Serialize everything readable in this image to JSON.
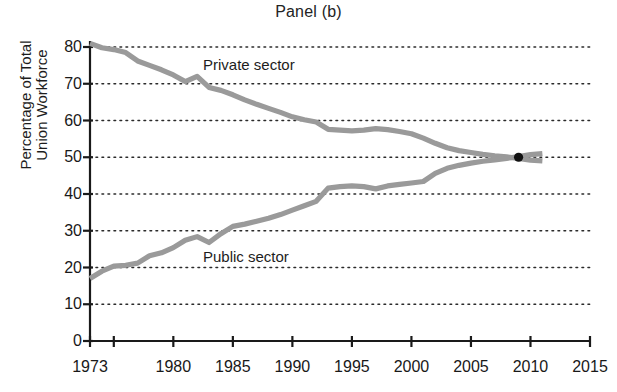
{
  "chart_data": {
    "type": "line",
    "title": "Panel (b)",
    "xlabel": "",
    "ylabel": "Percentage of Total Union Workforce",
    "ylabel_lines": [
      "Percentage of Total",
      "Union Workforce"
    ],
    "xlim": [
      1973,
      2015
    ],
    "ylim": [
      0,
      80
    ],
    "grid": true,
    "grid_style": "dotted-horizontal",
    "legend": "inline-annotations",
    "xticks": [
      1973,
      1980,
      1985,
      1990,
      1995,
      2000,
      2005,
      2010,
      2015
    ],
    "xtick_labels": [
      "1973",
      "1980",
      "1985",
      "1990",
      "1995",
      "2000",
      "2005",
      "2010",
      "2015"
    ],
    "xminor_ticks": [
      1975
    ],
    "yticks": [
      0,
      10,
      20,
      30,
      40,
      50,
      60,
      70,
      80
    ],
    "ytick_labels": [
      "0",
      "10",
      "20",
      "30",
      "40",
      "50",
      "60",
      "70",
      "80"
    ],
    "x": [
      1973,
      1974,
      1975,
      1976,
      1977,
      1978,
      1979,
      1980,
      1981,
      1982,
      1983,
      1984,
      1985,
      1986,
      1987,
      1988,
      1989,
      1990,
      1991,
      1992,
      1993,
      1994,
      1995,
      1996,
      1997,
      1998,
      1999,
      2000,
      2001,
      2002,
      2003,
      2004,
      2005,
      2006,
      2007,
      2008,
      2009,
      2010,
      2011
    ],
    "series": [
      {
        "name": "Private sector",
        "color": "#9a9a9a",
        "values": [
          81.0,
          79.8,
          79.3,
          78.5,
          76.2,
          75.0,
          73.8,
          72.4,
          70.6,
          72.0,
          69.0,
          68.2,
          67.0,
          65.6,
          64.4,
          63.3,
          62.2,
          61.0,
          60.2,
          59.6,
          57.6,
          57.4,
          57.2,
          57.4,
          57.8,
          57.5,
          57.0,
          56.4,
          55.2,
          53.8,
          52.6,
          51.8,
          51.3,
          50.8,
          50.4,
          50.1,
          49.7,
          49.2,
          49.0
        ]
      },
      {
        "name": "Public sector",
        "color": "#9a9a9a",
        "values": [
          17.0,
          19.0,
          20.4,
          20.6,
          21.2,
          23.2,
          24.0,
          25.4,
          27.4,
          28.4,
          26.8,
          29.2,
          31.2,
          31.8,
          32.6,
          33.4,
          34.4,
          35.6,
          36.8,
          38.0,
          41.6,
          42.0,
          42.2,
          42.0,
          41.4,
          42.2,
          42.6,
          43.0,
          43.4,
          45.6,
          47.0,
          47.8,
          48.4,
          48.9,
          49.3,
          49.7,
          50.2,
          50.7,
          51.0
        ]
      }
    ],
    "annotations": [
      {
        "name": "private-sector-label",
        "text": "Private sector",
        "x": 1984,
        "y": 73
      },
      {
        "name": "public-sector-label",
        "text": "Public sector",
        "x": 1984,
        "y": 24
      },
      {
        "name": "crossover-point",
        "marker": "filled-circle",
        "x": 2009,
        "y": 50,
        "color": "#111111"
      }
    ]
  },
  "styles": {
    "line_color": "#9a9a9a",
    "axis_color": "#1a1a1a",
    "grid_color": "#2b2b2b",
    "text_color": "#1a1a1a",
    "background": "#ffffff"
  }
}
